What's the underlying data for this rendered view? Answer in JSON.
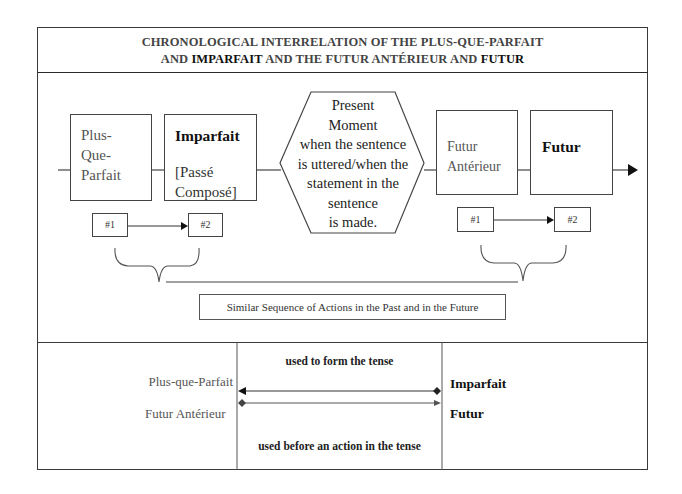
{
  "title": {
    "line1": "CHRONOLOGICAL INTERRELATION OF THE PLUS-QUE-PARFAIT",
    "line2_prefix": "AND ",
    "line2_bold1": "IMPARFAIT",
    "line2_middle": " AND THE FUTUR ANTÉRIEUR AND ",
    "line2_bold2": "FUTUR"
  },
  "timeline": {
    "past": {
      "first": {
        "lines": [
          "Plus-",
          "Que-",
          "Parfait"
        ]
      },
      "second": {
        "title": "Imparfait",
        "sub_lines": [
          "[Passé",
          "Composé]"
        ]
      },
      "seq": {
        "first": "#1",
        "second": "#2"
      }
    },
    "present": {
      "lines": [
        "Present",
        "Moment",
        "when the sentence",
        "is uttered/when the",
        "statement in the",
        "sentence",
        "is made."
      ]
    },
    "future": {
      "first": {
        "lines": [
          "Futur",
          "Antérieur"
        ]
      },
      "second": {
        "title": "Futur"
      },
      "seq": {
        "first": "#1",
        "second": "#2"
      }
    },
    "caption": "Similar Sequence of Actions in the Past and in the Future"
  },
  "relations": {
    "left": {
      "row1": "Plus-que-Parfait",
      "row2": "Futur Antérieur"
    },
    "middle": {
      "top": "used to form the tense",
      "bottom": "used before an action in the tense"
    },
    "right": {
      "row1": "Imparfait",
      "row2": "Futur"
    }
  }
}
